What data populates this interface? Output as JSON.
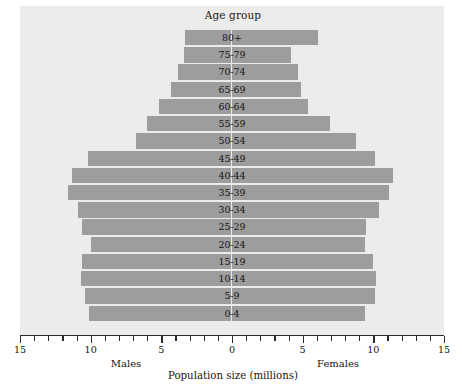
{
  "chart_data": {
    "type": "bar",
    "subtype": "population-pyramid",
    "title": "Age group",
    "xlabel": "Population size (millions)",
    "ylabel": "Age group",
    "xlim": [
      -15,
      15
    ],
    "xtick_labels": [
      "15",
      "10",
      "5",
      "0",
      "5",
      "10",
      "15"
    ],
    "xtick_values": [
      -15,
      -10,
      -5,
      0,
      5,
      10,
      15
    ],
    "minor_tick_step": 1,
    "grid": false,
    "legend": "none",
    "bar_color": "#9d9d9d",
    "panel_color": "#ececeb",
    "side_labels": {
      "left": "Males",
      "right": "Females"
    },
    "categories": [
      "80+",
      "75-79",
      "70-74",
      "65-69",
      "60-64",
      "55-59",
      "50-54",
      "45-49",
      "40-44",
      "35-39",
      "30-34",
      "25-29",
      "20-24",
      "15-19",
      "10-14",
      "5-9",
      "0-4"
    ],
    "series": [
      {
        "name": "Males",
        "side": "left",
        "values": [
          3.3,
          3.4,
          3.8,
          4.3,
          5.2,
          6.0,
          6.8,
          10.2,
          11.3,
          11.6,
          10.9,
          10.6,
          10.0,
          10.6,
          10.7,
          10.4,
          10.1
        ]
      },
      {
        "name": "Females",
        "side": "right",
        "values": [
          6.1,
          4.2,
          4.7,
          4.9,
          5.4,
          6.9,
          8.8,
          10.1,
          11.4,
          11.1,
          10.4,
          9.5,
          9.4,
          10.0,
          10.2,
          10.1,
          9.4
        ]
      }
    ]
  }
}
